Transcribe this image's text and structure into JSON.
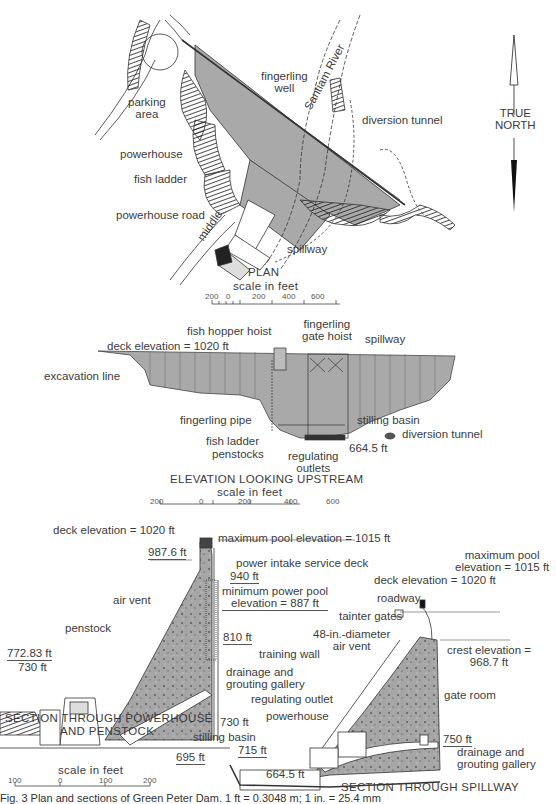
{
  "figure": {
    "caption": "Fig. 3   Plan and sections of Green Peter Dam. 1 ft = 0.3048 m; 1 in. = 25.4 mm",
    "colors": {
      "concrete_fill": "#a9a9a9",
      "line": "#333333",
      "background": "#ffffff"
    }
  },
  "plan": {
    "title": "PLAN",
    "scale_label": "scale in feet",
    "scale_ticks": [
      "200",
      "0",
      "200",
      "400",
      "600"
    ],
    "labels": {
      "parking_area_1": "parking",
      "parking_area_2": "area",
      "powerhouse": "powerhouse",
      "fish_ladder": "fish ladder",
      "powerhouse_road": "powerhouse road",
      "middle": "middle",
      "fingerling_well_1": "fingerling",
      "fingerling_well_2": "well",
      "santiam_river": "Santiam River",
      "diversion_tunnel": "diversion tunnel",
      "spillway": "spillway"
    },
    "north_arrow": {
      "line1": "TRUE",
      "line2": "NORTH",
      "icon": "north-arrow-icon"
    }
  },
  "elevation": {
    "title": "ELEVATION LOOKING UPSTREAM",
    "scale_label": "scale in feet",
    "scale_ticks": [
      "200",
      "0",
      "200",
      "400",
      "600"
    ],
    "labels": {
      "fish_hopper_hoist": "fish hopper hoist",
      "fingerling_gate_hoist_1": "fingerling",
      "fingerling_gate_hoist_2": "gate hoist",
      "spillway": "spillway",
      "deck_elevation": "deck elevation = 1020 ft",
      "excavation_line": "excavation line",
      "fingerling_pipe": "fingerling pipe",
      "stilling_basin": "stilling basin",
      "diversion_tunnel": "diversion tunnel",
      "fish_ladder": "fish ladder",
      "penstocks": "penstocks",
      "regulating_outlets_1": "regulating",
      "regulating_outlets_2": "outlets",
      "elev_664": "664.5 ft"
    }
  },
  "section_powerhouse": {
    "title_1": "SECTION THROUGH POWERHOUSE",
    "title_2": "AND PENSTOCK",
    "scale_label": "scale in feet",
    "scale_ticks": [
      "100",
      "0",
      "100",
      "200"
    ],
    "labels": {
      "deck_elevation": "deck elevation = 1020 ft",
      "max_pool": "maximum pool elevation = 1015 ft",
      "elev_987": "987.6 ft",
      "power_intake": "power intake service deck",
      "elev_940": "940 ft",
      "min_power_pool_1": "minimum power pool",
      "min_power_pool_2": "elevation = 887 ft",
      "air_vent": "air vent",
      "penstock": "penstock",
      "elev_810": "810 ft",
      "elev_772": "772.83 ft",
      "elev_730": "730 ft",
      "drainage_1": "drainage and",
      "drainage_2": "grouting gallery"
    }
  },
  "section_spillway": {
    "title": "SECTION THROUGH SPILLWAY",
    "labels": {
      "max_pool_1": "maximum pool",
      "max_pool_2": "elevation = 1015 ft",
      "deck_elevation": "deck elevation = 1020 ft",
      "roadway": "roadway",
      "tainter_gates": "tainter gates",
      "air_vent_1": "48-in.-diameter",
      "air_vent_2": "air vent",
      "crest_1": "crest elevation =",
      "crest_2": "968.7 ft",
      "training_wall": "training wall",
      "regulating_outlet": "regulating outlet",
      "powerhouse": "powerhouse",
      "gate_room": "gate room",
      "elev_730": "730 ft",
      "stilling_basin": "stilling basin",
      "elev_715": "715 ft",
      "elev_695": "695 ft",
      "elev_750": "750 ft",
      "elev_664": "664.5 ft",
      "drainage_1": "drainage and",
      "drainage_2": "grouting gallery"
    }
  }
}
